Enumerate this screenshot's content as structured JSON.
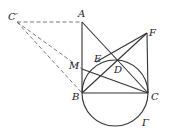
{
  "figure": {
    "labels": {
      "Cp": "C′",
      "A": "A",
      "F": "F",
      "E": "E",
      "M": "M",
      "D": "D",
      "B": "B",
      "C": "C",
      "Gamma": "Γ"
    },
    "points": {
      "Cp": [
        17,
        22
      ],
      "A": [
        82,
        22
      ],
      "F": [
        147,
        33
      ],
      "B": [
        82,
        93
      ],
      "C": [
        148,
        93
      ],
      "D": [
        117,
        61
      ],
      "E": [
        96,
        62
      ],
      "M": [
        82,
        69
      ]
    },
    "circle": {
      "name": "Γ",
      "center": [
        115,
        93
      ],
      "radius": 33
    }
  }
}
